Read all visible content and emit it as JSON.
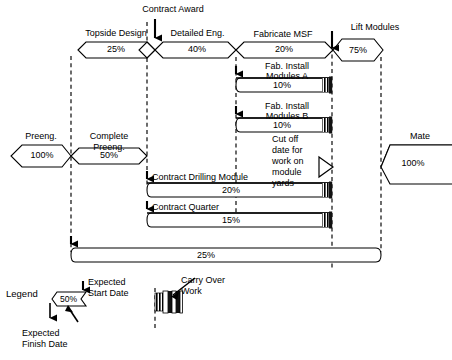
{
  "diagram": {
    "title_milestones": {
      "contract_award": "Contract Award",
      "lift_modules": "Lift Modules",
      "mate": "Mate"
    },
    "activities": [
      {
        "id": "topside-design",
        "label": "Topside Design",
        "percent": "25%",
        "shape": "arrow-hex"
      },
      {
        "id": "detailed-eng",
        "label": "Detailed Eng.",
        "percent": "40%",
        "shape": "arrow-hex"
      },
      {
        "id": "fabricate-msf",
        "label": "Fabricate MSF",
        "percent": "20%",
        "shape": "arrow-hex"
      },
      {
        "id": "lift-modules",
        "label": "Lift Modules",
        "percent": "75%",
        "shape": "hexagon"
      },
      {
        "id": "preeng",
        "label": "Preeng.",
        "percent": "100%",
        "shape": "hexagon"
      },
      {
        "id": "complete-preeng",
        "label": "Complete Preeng.",
        "percent": "50%",
        "shape": "arrow-hex"
      },
      {
        "id": "mate",
        "label": "Mate",
        "percent": "100%",
        "shape": "hexagon"
      },
      {
        "id": "fab-install-modules-a",
        "label": "Fab. Install Modules A",
        "percent": "10%",
        "shape": "bar"
      },
      {
        "id": "fab-install-modules-b",
        "label": "Fab. Install Modules B",
        "percent": "10%",
        "shape": "bar"
      },
      {
        "id": "contract-drilling-module",
        "label": "Contract Drilling Module",
        "percent": "20%",
        "shape": "bar"
      },
      {
        "id": "contract-quarter",
        "label": "Contract Quarter",
        "percent": "15%",
        "shape": "bar"
      },
      {
        "id": "summary-bar",
        "label": "",
        "percent": "25%",
        "shape": "bar"
      }
    ],
    "labels": {
      "topside_design": "Topside Design",
      "topside_design_pct": "25%",
      "contract_award": "Contract Award",
      "detailed_eng": "Detailed Eng.",
      "detailed_eng_pct": "40%",
      "fabricate_msf": "Fabricate MSF",
      "fabricate_msf_pct": "20%",
      "lift_modules": "Lift Modules",
      "lift_modules_pct": "75%",
      "fab_install_a_line1": "Fab. Install",
      "fab_install_a_line2": "Modules A",
      "fab_install_a_pct": "10%",
      "fab_install_b_line1": "Fab. Install",
      "fab_install_b_line2": "Modules B",
      "fab_install_b_pct": "10%",
      "cutoff_line1": "Cut off",
      "cutoff_line2": "date for",
      "cutoff_line3": "work on",
      "cutoff_line4": "module",
      "cutoff_line5": "yards",
      "preeng": "Preeng.",
      "preeng_pct": "100%",
      "complete_preeng_line1": "Complete",
      "complete_preeng_line2": "Preeng.",
      "complete_preeng_pct": "50%",
      "mate": "Mate",
      "mate_pct": "100%",
      "contract_drilling_module": "Contract Drilling Module",
      "contract_drilling_module_pct": "20%",
      "contract_quarter": "Contract Quarter",
      "contract_quarter_pct": "15%",
      "summary_pct": "25%"
    },
    "legend": {
      "title": "Legend",
      "sample_pct": "50%",
      "expected_start_line1": "Expected",
      "expected_start_line2": "Start Date",
      "expected_finish_line1": "Expected",
      "expected_finish_line2": "Finish Date",
      "carry_over_line1": "Carry Over",
      "carry_over_line2": "Work"
    },
    "colors": {
      "stroke": "#000000",
      "fill": "#ffffff",
      "background": "#ffffff",
      "carry_over": "#1a1a1a"
    }
  }
}
